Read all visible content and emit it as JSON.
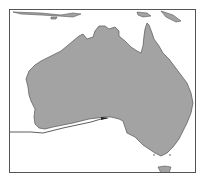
{
  "map": {
    "title": "Australia",
    "land_color": "#a3a3a3",
    "coast_color": "#555555",
    "water_color": "#ffffff",
    "route_color": "#333333",
    "features": [
      {
        "name": "Australia mainland"
      },
      {
        "name": "Tasmania"
      },
      {
        "name": "Great Australian Bight route line"
      }
    ]
  }
}
